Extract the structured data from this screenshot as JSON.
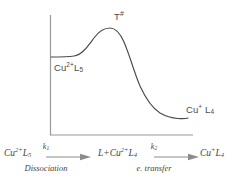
{
  "diagram": {
    "type": "reaction-coordinate-energy-profile",
    "axes": {
      "y_axis": "energy",
      "x_axis": "reaction-coordinate",
      "ticks": false,
      "grid": false
    },
    "curve": {
      "description": "energy profile rising from reactant plateau through transition state to lower product plateau",
      "reactant_level": 57,
      "peak": {
        "x": 110,
        "y": 28
      },
      "product_level": 118
    },
    "labels": {
      "reactant": {
        "text": "Cu",
        "sup": "2+",
        "tail": "L",
        "sub": "5"
      },
      "transition_state": {
        "text": "T",
        "sup": "#"
      },
      "product": {
        "text": "Cu",
        "sup": "+",
        "tail": " L",
        "sub": "4"
      }
    },
    "colors": {
      "curve": "#4a4a4a",
      "axis": "#9a9a9a",
      "text": "#454545"
    }
  },
  "equation": {
    "terms": [
      {
        "pre": "Cu",
        "sup": "2+",
        "mid": "L",
        "sub": "5"
      },
      {
        "pre": "L+Cu",
        "sup": "2+",
        "mid": "L",
        "sub": "4"
      },
      {
        "pre": "Cu",
        "sup": "+",
        "mid": "L",
        "sub": "4"
      }
    ],
    "steps": [
      {
        "rate_symbol": "k",
        "rate_index": "1",
        "caption": "Dissociation"
      },
      {
        "rate_symbol": "k",
        "rate_index": "2",
        "caption": "e. transfer"
      }
    ]
  }
}
